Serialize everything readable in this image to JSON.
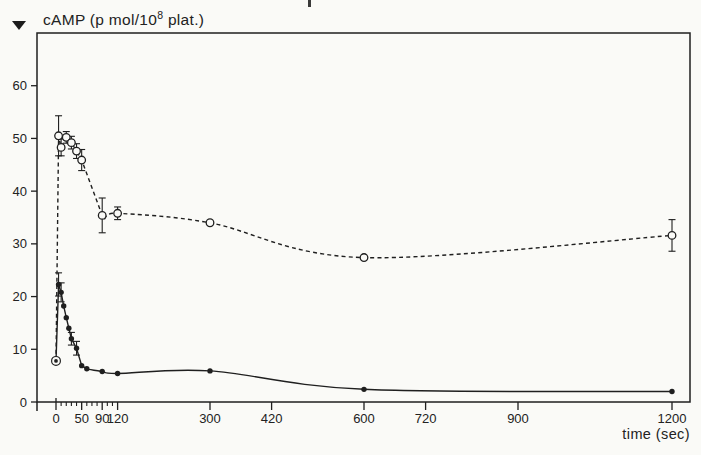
{
  "figure": {
    "top_crop_artifact": true
  },
  "chart_data": {
    "type": "line",
    "title": {
      "prefix": "cAMP (p mol/10",
      "superscript": "8",
      "suffix": " plat.)"
    },
    "xlabel": "time (sec)",
    "ylabel": "cAMP (p mol/10^8 plat.)",
    "x_ticks": [
      0,
      50,
      90,
      120,
      300,
      420,
      600,
      720,
      900,
      1200
    ],
    "x_minor_ticks": [
      10,
      20,
      30,
      40,
      60,
      70,
      80,
      100,
      110
    ],
    "y_ticks": [
      0,
      10,
      20,
      30,
      40,
      50,
      60
    ],
    "xlim": [
      0,
      1236
    ],
    "ylim": [
      0,
      70
    ],
    "grid": false,
    "legend": "none",
    "colors": {
      "ink": "#1f1f1f",
      "paper": "#fafaf7"
    },
    "origin_marker": {
      "t": 0,
      "v": 7.8,
      "style": "circled-dot"
    },
    "series": [
      {
        "name": "open-circle-dashed-series",
        "line": "dashed",
        "marker": "open-circle",
        "points": [
          {
            "t": 0,
            "v": 7.8
          },
          {
            "t": 5,
            "v": 50.5,
            "e": 3.8
          },
          {
            "t": 10,
            "v": 48.3,
            "e": 1.6
          },
          {
            "t": 20,
            "v": 50.2,
            "e": 1.1
          },
          {
            "t": 30,
            "v": 49.2,
            "e": 1.2
          },
          {
            "t": 40,
            "v": 47.6,
            "e": 1.4
          },
          {
            "t": 50,
            "v": 45.9,
            "e": 2.0
          },
          {
            "t": 90,
            "v": 35.4,
            "e": 3.3
          },
          {
            "t": 120,
            "v": 35.8,
            "e": 1.2
          },
          {
            "t": 300,
            "v": 34.0
          },
          {
            "t": 600,
            "v": 27.4
          },
          {
            "t": 1200,
            "v": 31.6,
            "e": 3.0
          }
        ]
      },
      {
        "name": "filled-circle-solid-series",
        "line": "solid",
        "marker": "filled-circle",
        "points": [
          {
            "t": 0,
            "v": 7.8
          },
          {
            "t": 5,
            "v": 22.3,
            "e": 2.2
          },
          {
            "t": 10,
            "v": 20.8,
            "e": 1.8
          },
          {
            "t": 15,
            "v": 18.2
          },
          {
            "t": 20,
            "v": 16.0
          },
          {
            "t": 25,
            "v": 14.0
          },
          {
            "t": 30,
            "v": 12.0,
            "e": 1.2
          },
          {
            "t": 40,
            "v": 10.2,
            "e": 1.3
          },
          {
            "t": 50,
            "v": 6.9
          },
          {
            "t": 60,
            "v": 6.3
          },
          {
            "t": 90,
            "v": 5.8
          },
          {
            "t": 120,
            "v": 5.4
          },
          {
            "t": 300,
            "v": 5.9
          },
          {
            "t": 600,
            "v": 2.4
          },
          {
            "t": 1200,
            "v": 2.0
          }
        ]
      }
    ]
  }
}
